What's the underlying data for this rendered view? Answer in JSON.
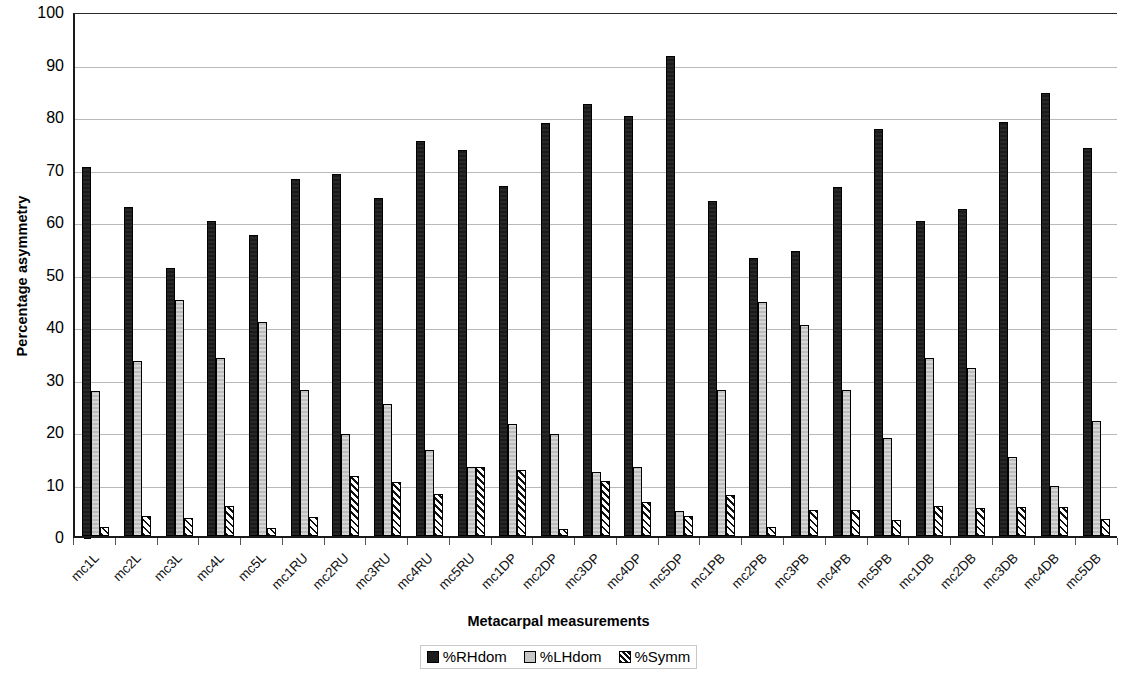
{
  "chart_data": {
    "type": "bar",
    "title": "",
    "xlabel": "Metacarpal measurements",
    "ylabel": "Percentage asymmetry",
    "ylim": [
      0,
      100
    ],
    "ytick_step": 10,
    "yticks": [
      0,
      10,
      20,
      30,
      40,
      50,
      60,
      70,
      80,
      90,
      100
    ],
    "grid": true,
    "legend_position": "bottom",
    "categories": [
      "mc1L",
      "mc2L",
      "mc3L",
      "mc4L",
      "mc5L",
      "mc1RU",
      "mc2RU",
      "mc3RU",
      "mc4RU",
      "mc5RU",
      "mc1DP",
      "mc2DP",
      "mc3DP",
      "mc4DP",
      "mc5DP",
      "mc1PB",
      "mc2PB",
      "mc3PB",
      "mc4PB",
      "mc5PB",
      "mc1DB",
      "mc2DB",
      "mc3DB",
      "mc4DB",
      "mc5DB"
    ],
    "series": [
      {
        "name": "%RHdom",
        "color": "#1c1c1c",
        "values": [
          70.3,
          62.6,
          51.0,
          60.0,
          57.4,
          68.0,
          68.9,
          64.3,
          75.2,
          73.5,
          66.6,
          78.7,
          82.3,
          80.0,
          91.5,
          63.9,
          53.0,
          54.2,
          66.5,
          77.5,
          60.0,
          62.2,
          78.8,
          84.3,
          74.0
        ]
      },
      {
        "name": "%LHdom",
        "color": "#c6c6c6",
        "values": [
          27.6,
          33.3,
          45.0,
          34.0,
          40.7,
          27.8,
          19.5,
          25.2,
          16.4,
          13.1,
          21.3,
          19.5,
          12.2,
          13.2,
          4.8,
          27.9,
          44.5,
          40.2,
          27.9,
          18.6,
          34.0,
          32.0,
          15.1,
          9.5,
          21.9
        ]
      },
      {
        "name": "%Symm",
        "color": "#ffffff",
        "pattern": "diagonal-hatch",
        "values": [
          1.8,
          3.8,
          3.5,
          5.7,
          1.5,
          3.7,
          11.5,
          10.2,
          8.0,
          13.2,
          12.5,
          1.3,
          10.5,
          6.5,
          3.8,
          7.8,
          1.8,
          5.0,
          5.0,
          3.1,
          5.7,
          5.4,
          5.5,
          5.6,
          3.3
        ]
      }
    ]
  },
  "legend": {
    "items": [
      {
        "label": "%RHdom",
        "swatch": "rh"
      },
      {
        "label": "%LHdom",
        "swatch": "lh"
      },
      {
        "label": "%Symm",
        "swatch": "sym"
      }
    ]
  }
}
